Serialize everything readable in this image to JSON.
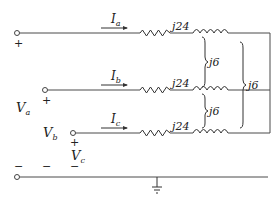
{
  "diagram": {
    "type": "three-phase-circuit",
    "currents": [
      {
        "name": "I",
        "sub": "a"
      },
      {
        "name": "I",
        "sub": "b"
      },
      {
        "name": "I",
        "sub": "c"
      }
    ],
    "voltages": [
      {
        "name": "V",
        "sub": "a"
      },
      {
        "name": "V",
        "sub": "b"
      },
      {
        "name": "V",
        "sub": "c"
      }
    ],
    "self_impedance_label": "j24",
    "mutual_impedance_label": "j6",
    "plus_sign": "+",
    "minus_sign": "−",
    "colors": {
      "line": "#4a4a4a",
      "text": "#222222",
      "background": "#ffffff"
    }
  }
}
